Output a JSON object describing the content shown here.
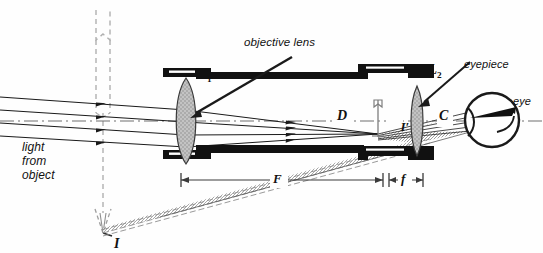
{
  "figure": {
    "width": 543,
    "height": 253,
    "background_color": "#fefefe",
    "ink_color": "#1a1a1a",
    "dashed_color": "#9a9a9a",
    "lens_fill_color": "#b9b9b9",
    "barrel_color": "#111111"
  },
  "labels": {
    "objective_lens": "objective lens",
    "eyepiece": "eyepiece",
    "eye": "eye",
    "light_from_object_line1": "light",
    "light_from_object_line2": "from",
    "light_from_object_line3": "object",
    "lens_one": "L",
    "lens_one_sub": "1",
    "lens_two": "L",
    "lens_two_sub": "2",
    "distance_d": "D",
    "distance_c": "C",
    "intermediate_image": "I",
    "intermediate_image_prime": "′",
    "final_image": "I",
    "focal_length_objective": "F",
    "focal_length_eyepiece": "f"
  },
  "optics": {
    "axis_y": 121,
    "objective_lens_x": 186,
    "eyepiece_lens_x": 417,
    "intermediate_image_x": 378,
    "eye_center_x": 492,
    "eye_center_y": 120,
    "eye_radius": 27,
    "incoming_ray_count": 4,
    "incoming_ray_arrow_x": 103
  },
  "dimensions": {
    "baseline_y": 180,
    "F_start_x": 181,
    "F_end_x": 383,
    "F_label_x": 278,
    "f_start_x": 389,
    "f_end_x": 423,
    "f_label_x": 404
  },
  "notes": {
    "object_arrow_style": "dashed-outline-up",
    "image_arrow_style": "dashed-outline-down",
    "ray_style": "solid-thin-black",
    "virtual_ray_style": "dashed-thin-gray"
  }
}
